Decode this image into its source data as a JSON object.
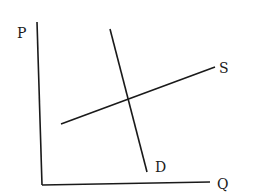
{
  "diagram": {
    "type": "supply-demand",
    "title": "",
    "axes": {
      "y_label": "P",
      "x_label": "Q",
      "origin": [
        42,
        185
      ],
      "y_top": [
        37,
        22
      ],
      "x_end": [
        210,
        182
      ]
    },
    "curves": [
      {
        "name": "demand",
        "label": "D",
        "from": [
          110,
          29
        ],
        "to": [
          147,
          172
        ],
        "slope": "steep-negative"
      },
      {
        "name": "supply",
        "label": "S",
        "from": [
          61,
          124
        ],
        "to": [
          215,
          67
        ],
        "slope": "shallow-positive"
      }
    ],
    "equilibrium": [
      128,
      99
    ],
    "line_color": "#1a1a1a",
    "background": "#ffffff"
  },
  "labels": {
    "p": "P",
    "q": "Q",
    "s": "S",
    "d": "D"
  }
}
